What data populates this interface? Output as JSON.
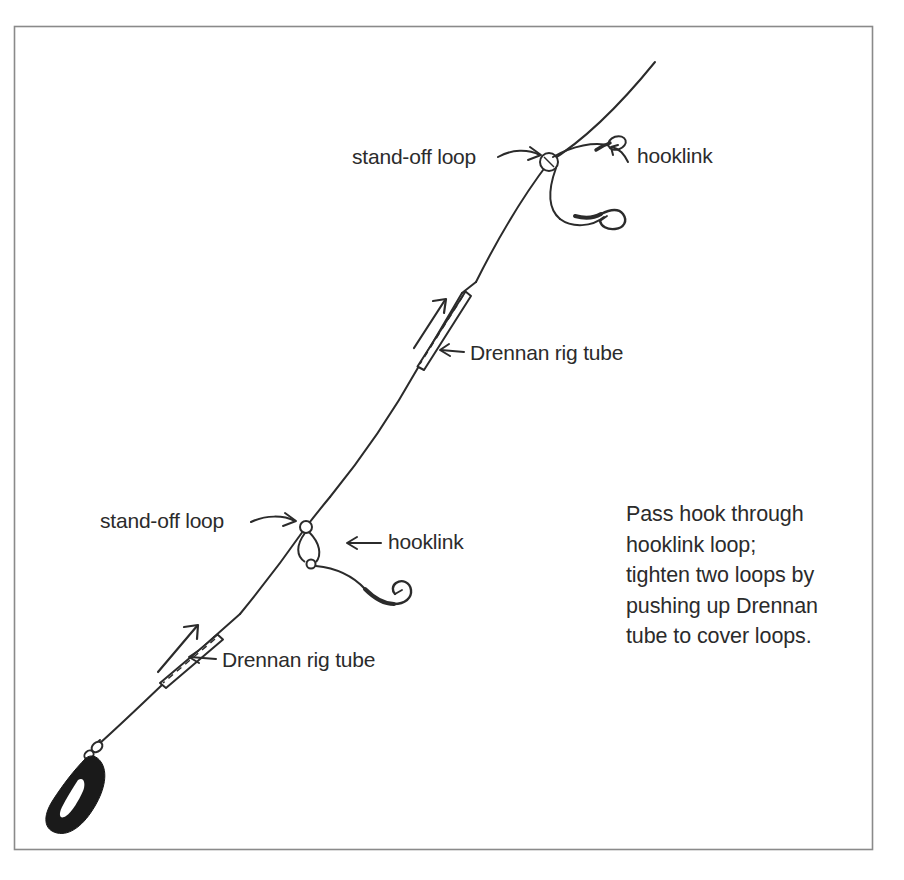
{
  "diagram": {
    "background_color": "#ffffff",
    "ink_color": "#2b2b2b",
    "border": {
      "name": "page-border",
      "x": 14,
      "y": 26,
      "width": 859,
      "height": 824,
      "color": "#8a8a8a"
    },
    "labels": [
      {
        "id": "standoff-upper",
        "text": "stand-off loop",
        "x": 352,
        "y": 164,
        "anchor": "start"
      },
      {
        "id": "hooklink-upper",
        "text": "hooklink",
        "x": 637,
        "y": 163,
        "anchor": "start"
      },
      {
        "id": "tube-upper",
        "text": "Drennan rig tube",
        "x": 470,
        "y": 360,
        "anchor": "start"
      },
      {
        "id": "standoff-lower",
        "text": "stand-off loop",
        "x": 100,
        "y": 528,
        "anchor": "start"
      },
      {
        "id": "hooklink-lower",
        "text": "hooklink",
        "x": 388,
        "y": 549,
        "anchor": "start"
      },
      {
        "id": "tube-lower",
        "text": "Drennan rig tube",
        "x": 222,
        "y": 667,
        "anchor": "start"
      }
    ],
    "note": {
      "x": 626,
      "y": 521,
      "line_height": 30.5,
      "lines": [
        "Pass hook through",
        "hooklink loop;",
        "tighten two loops by",
        "pushing up Drennan",
        "tube to cover loops."
      ]
    },
    "components": {
      "main_line": {
        "name": "main-line",
        "top_end": [
          655,
          62
        ],
        "bottom_end": [
          98,
          742
        ]
      },
      "lead_weight": {
        "name": "lead-weight",
        "shape": "teardrop",
        "fill": "#1a1a1a",
        "center": [
          77,
          785
        ]
      },
      "swivel": {
        "name": "swivel",
        "position": [
          98,
          745
        ]
      },
      "stand_off_loops": [
        {
          "name": "stand-off-loop-upper",
          "position": [
            549,
            162
          ],
          "state": "open-ring"
        },
        {
          "name": "stand-off-loop-lower",
          "position": [
            306,
            527
          ],
          "state": "tightened"
        }
      ],
      "rig_tubes": [
        {
          "name": "rig-tube-upper",
          "from": [
            462,
            293
          ],
          "to": [
            419,
            366
          ]
        },
        {
          "name": "rig-tube-lower",
          "from": [
            214,
            637
          ],
          "to": [
            163,
            684
          ]
        }
      ],
      "hooks": [
        {
          "name": "hook-upper",
          "position": [
            612,
            214
          ]
        },
        {
          "name": "hook-lower",
          "position": [
            398,
            578
          ]
        }
      ],
      "push_arrows": [
        {
          "name": "push-arrow-upper",
          "from": [
            418,
            345
          ],
          "to": [
            444,
            302
          ]
        },
        {
          "name": "push-arrow-lower",
          "from": [
            163,
            668
          ],
          "to": [
            196,
            628
          ]
        }
      ],
      "pointer_arrows": [
        {
          "name": "pointer-standoff-upper",
          "from": [
            500,
            158
          ],
          "to": [
            541,
            155
          ]
        },
        {
          "name": "pointer-hooklink-upper",
          "from": [
            628,
            160
          ],
          "to": [
            612,
            148
          ]
        },
        {
          "name": "pointer-tube-upper",
          "from": [
            464,
            353
          ],
          "to": [
            441,
            349
          ]
        },
        {
          "name": "pointer-standoff-lower",
          "from": [
            253,
            523
          ],
          "to": [
            296,
            521
          ]
        },
        {
          "name": "pointer-hooklink-lower",
          "from": [
            380,
            543
          ],
          "to": [
            348,
            543
          ]
        },
        {
          "name": "pointer-tube-lower",
          "from": [
            215,
            660
          ],
          "to": [
            189,
            657
          ]
        }
      ]
    }
  }
}
